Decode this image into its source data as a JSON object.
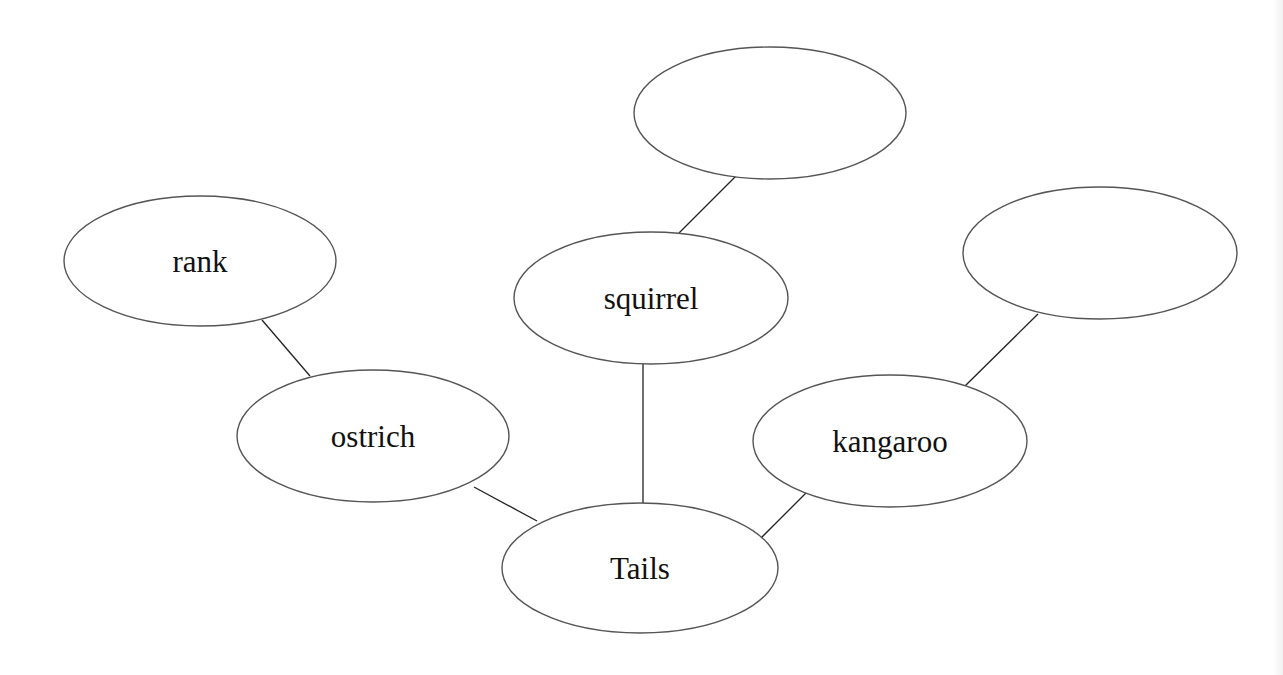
{
  "diagram": {
    "type": "word-web",
    "center": "Tails",
    "nodes": [
      {
        "id": "tails",
        "label": "Tails",
        "cx": 640,
        "cy": 568,
        "rx": 138,
        "ry": 65
      },
      {
        "id": "ostrich",
        "label": "ostrich",
        "cx": 373,
        "cy": 436,
        "rx": 136,
        "ry": 66
      },
      {
        "id": "rank",
        "label": "rank",
        "cx": 200,
        "cy": 261,
        "rx": 136,
        "ry": 65
      },
      {
        "id": "squirrel",
        "label": "squirrel",
        "cx": 651,
        "cy": 298,
        "rx": 137,
        "ry": 66
      },
      {
        "id": "blank-top",
        "label": "",
        "cx": 770,
        "cy": 113,
        "rx": 136,
        "ry": 66
      },
      {
        "id": "kangaroo",
        "label": "kangaroo",
        "cx": 890,
        "cy": 441,
        "rx": 137,
        "ry": 66
      },
      {
        "id": "blank-right",
        "label": "",
        "cx": 1100,
        "cy": 253,
        "rx": 137,
        "ry": 66
      }
    ],
    "edges": [
      {
        "from": "rank",
        "to": "ostrich",
        "x1": 262,
        "y1": 320,
        "x2": 310,
        "y2": 376
      },
      {
        "from": "ostrich",
        "to": "tails",
        "x1": 474,
        "y1": 487,
        "x2": 537,
        "y2": 521
      },
      {
        "from": "squirrel",
        "to": "tails",
        "x1": 643,
        "y1": 364,
        "x2": 643,
        "y2": 503
      },
      {
        "from": "squirrel",
        "to": "blank-top",
        "x1": 679,
        "y1": 233,
        "x2": 739,
        "y2": 173
      },
      {
        "from": "kangaroo",
        "to": "tails",
        "x1": 807,
        "y1": 492,
        "x2": 758,
        "y2": 541
      },
      {
        "from": "kangaroo",
        "to": "blank-right",
        "x1": 965,
        "y1": 386,
        "x2": 1038,
        "y2": 314
      }
    ]
  }
}
